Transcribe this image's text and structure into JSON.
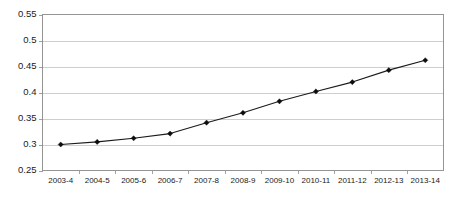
{
  "chart_data": {
    "type": "line",
    "title": "",
    "subtitle": "",
    "xlabel": "",
    "ylabel": "",
    "categories": [
      "2003-4",
      "2004-5",
      "2005-6",
      "2006-7",
      "2007-8",
      "2008-9",
      "2009-10",
      "2010-11",
      "2011-12",
      "2012-13",
      "2013-14"
    ],
    "values": [
      0.3,
      0.305,
      0.312,
      0.321,
      0.342,
      0.361,
      0.383,
      0.402,
      0.42,
      0.443,
      0.462
    ],
    "series": [
      {
        "name": "",
        "values": [
          0.3,
          0.305,
          0.312,
          0.321,
          0.342,
          0.361,
          0.383,
          0.402,
          0.42,
          0.443,
          0.462
        ]
      }
    ],
    "ylim": [
      0.25,
      0.55
    ],
    "ytick_values": [
      0.25,
      0.3,
      0.35,
      0.4,
      0.45,
      0.5,
      0.55
    ],
    "ytick_labels": [
      "0.25",
      "0.3",
      "0.35",
      "0.4",
      "0.45",
      "0.5",
      "0.55"
    ],
    "grid": "horizontal",
    "legend": "none",
    "marker": "diamond",
    "line_color": "#1a1a1a",
    "marker_color": "#0d0d0d",
    "gridline_color": "#b9b9b9",
    "frame_color": "#8a8a8a",
    "background_color": "#ffffff",
    "annotations": []
  }
}
